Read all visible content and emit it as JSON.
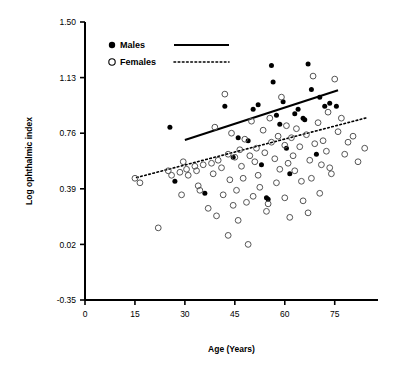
{
  "chart_data": {
    "type": "scatter",
    "title": "",
    "xlabel": "Age (Years)",
    "ylabel": "Log ophthalmic index",
    "xlim": [
      0,
      88
    ],
    "ylim": [
      -0.35,
      1.5
    ],
    "xticks": [
      0,
      15,
      30,
      45,
      60,
      75
    ],
    "xtick_labels": [
      "0",
      "15",
      "30",
      "45",
      "60",
      "75"
    ],
    "yticks": [
      -0.35,
      0.02,
      0.39,
      0.76,
      1.13,
      1.5
    ],
    "ytick_labels": [
      "-0.35",
      "0.02",
      "0.39",
      "0.76",
      "1.13",
      "1.50"
    ],
    "grid": false,
    "legend_position": "top-left-inside",
    "legend": [
      {
        "name": "Males",
        "marker": "filled-circle",
        "line": "solid"
      },
      {
        "name": "Females",
        "marker": "open-circle",
        "line": "dotted"
      }
    ],
    "series": [
      {
        "name": "Males",
        "marker": "filled-circle",
        "color": "#000000",
        "points": [
          [
            25.5,
            0.8
          ],
          [
            27.0,
            0.44
          ],
          [
            36.0,
            0.36
          ],
          [
            44.5,
            0.6
          ],
          [
            49.0,
            0.71
          ],
          [
            50.5,
            0.92
          ],
          [
            52.0,
            0.95
          ],
          [
            53.0,
            0.55
          ],
          [
            54.5,
            0.33
          ],
          [
            55.0,
            0.32
          ],
          [
            56.0,
            1.21
          ],
          [
            56.5,
            1.1
          ],
          [
            57.5,
            0.88
          ],
          [
            58.5,
            0.82
          ],
          [
            59.5,
            0.97
          ],
          [
            60.5,
            0.66
          ],
          [
            61.5,
            0.49
          ],
          [
            63.0,
            0.89
          ],
          [
            64.0,
            0.92
          ],
          [
            65.5,
            0.86
          ],
          [
            66.0,
            0.85
          ],
          [
            67.0,
            1.22
          ],
          [
            68.0,
            1.05
          ],
          [
            69.5,
            0.62
          ],
          [
            70.5,
            1.0
          ],
          [
            72.0,
            0.94
          ],
          [
            73.5,
            0.96
          ],
          [
            75.5,
            0.94
          ],
          [
            42.0,
            0.94
          ],
          [
            46.0,
            0.73
          ]
        ]
      },
      {
        "name": "Females",
        "marker": "open-circle",
        "color": "#555555",
        "points": [
          [
            15.0,
            0.46
          ],
          [
            16.5,
            0.43
          ],
          [
            22.0,
            0.13
          ],
          [
            25.0,
            0.51
          ],
          [
            26.0,
            0.48
          ],
          [
            28.5,
            0.5
          ],
          [
            29.5,
            0.57
          ],
          [
            30.5,
            0.52
          ],
          [
            31.0,
            0.48
          ],
          [
            33.0,
            0.54
          ],
          [
            34.0,
            0.41
          ],
          [
            35.5,
            0.55
          ],
          [
            37.0,
            0.26
          ],
          [
            38.0,
            0.56
          ],
          [
            39.0,
            0.8
          ],
          [
            40.0,
            0.58
          ],
          [
            41.0,
            0.53
          ],
          [
            42.0,
            1.02
          ],
          [
            43.0,
            0.62
          ],
          [
            43.5,
            0.45
          ],
          [
            44.0,
            0.76
          ],
          [
            45.0,
            0.6
          ],
          [
            45.5,
            0.38
          ],
          [
            46.5,
            0.65
          ],
          [
            47.0,
            0.54
          ],
          [
            48.0,
            0.72
          ],
          [
            48.5,
            0.3
          ],
          [
            49.5,
            0.61
          ],
          [
            50.0,
            0.84
          ],
          [
            51.0,
            0.57
          ],
          [
            51.5,
            0.66
          ],
          [
            52.5,
            0.4
          ],
          [
            53.5,
            0.78
          ],
          [
            54.0,
            0.63
          ],
          [
            55.5,
            0.86
          ],
          [
            56.0,
            0.7
          ],
          [
            57.0,
            0.59
          ],
          [
            58.0,
            0.74
          ],
          [
            58.5,
            0.52
          ],
          [
            59.0,
            1.0
          ],
          [
            60.0,
            0.68
          ],
          [
            60.5,
            0.81
          ],
          [
            61.0,
            0.56
          ],
          [
            62.0,
            0.73
          ],
          [
            62.5,
            0.61
          ],
          [
            63.5,
            0.79
          ],
          [
            64.5,
            0.67
          ],
          [
            65.0,
            0.44
          ],
          [
            66.5,
            0.75
          ],
          [
            67.5,
            0.58
          ],
          [
            68.5,
            1.14
          ],
          [
            69.0,
            0.69
          ],
          [
            70.0,
            0.83
          ],
          [
            71.0,
            0.55
          ],
          [
            71.5,
            0.71
          ],
          [
            72.5,
            0.64
          ],
          [
            73.0,
            0.9
          ],
          [
            74.0,
            0.49
          ],
          [
            75.0,
            1.12
          ],
          [
            76.0,
            0.77
          ],
          [
            77.0,
            0.86
          ],
          [
            78.0,
            0.62
          ],
          [
            79.0,
            0.7
          ],
          [
            80.5,
            0.74
          ],
          [
            82.0,
            0.57
          ],
          [
            84.0,
            0.66
          ],
          [
            33.5,
            0.51
          ],
          [
            38.5,
            0.49
          ],
          [
            41.5,
            0.35
          ],
          [
            47.5,
            0.46
          ],
          [
            52.0,
            0.48
          ],
          [
            57.5,
            0.43
          ],
          [
            63.0,
            0.51
          ],
          [
            68.0,
            0.46
          ],
          [
            73.5,
            0.53
          ],
          [
            44.5,
            0.28
          ],
          [
            50.5,
            0.34
          ],
          [
            55.0,
            0.29
          ],
          [
            60.0,
            0.33
          ],
          [
            65.5,
            0.31
          ],
          [
            70.5,
            0.36
          ],
          [
            39.5,
            0.21
          ],
          [
            46.0,
            0.18
          ],
          [
            54.5,
            0.24
          ],
          [
            61.5,
            0.2
          ],
          [
            67.0,
            0.23
          ],
          [
            34.5,
            0.38
          ],
          [
            29.0,
            0.35
          ],
          [
            43.0,
            0.08
          ],
          [
            49.0,
            0.02
          ]
        ]
      }
    ],
    "fit_lines": [
      {
        "name": "Males",
        "style": "solid",
        "x0": 30.0,
        "y0": 0.715,
        "x1": 76.0,
        "y1": 1.045
      },
      {
        "name": "Females",
        "style": "dotted",
        "x0": 15.5,
        "y0": 0.465,
        "x1": 85.0,
        "y1": 0.865
      }
    ]
  },
  "axes": {
    "y_title": "Log ophthalmic index",
    "x_title": "Age (Years)"
  },
  "legend": {
    "males_label": "Males",
    "females_label": "Females"
  }
}
